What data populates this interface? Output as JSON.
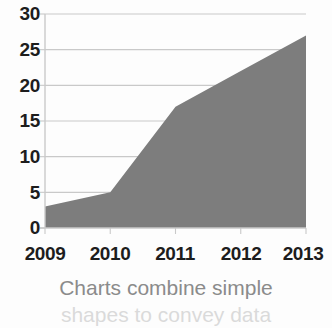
{
  "chart_data": {
    "type": "area",
    "title": "",
    "subtitle": "",
    "xlabel": "",
    "ylabel": "",
    "categories": [
      "2009",
      "2010",
      "2011",
      "2012",
      "2013"
    ],
    "x": [
      2009,
      2010,
      2011,
      2012,
      2013
    ],
    "values": [
      3,
      5,
      17,
      22,
      27
    ],
    "series": [
      {
        "name": "",
        "values": [
          3,
          5,
          17,
          22,
          27
        ],
        "color": "#7d7d7d"
      }
    ],
    "ylim": [
      0,
      30
    ],
    "xlim": [
      2009,
      2013
    ],
    "yticks": [
      0,
      5,
      10,
      15,
      20,
      25,
      30
    ],
    "ytick_labels": [
      "0",
      "5",
      "10",
      "15",
      "20",
      "25",
      "30"
    ],
    "xticks": [
      2009,
      2010,
      2011,
      2012,
      2013
    ],
    "xtick_labels": [
      "2009",
      "2010",
      "2011",
      "2012",
      "2013"
    ],
    "grid": "horizontal",
    "legend": "none",
    "annotations": []
  },
  "style": {
    "area_fill": "#7d7d7d",
    "gridline_color": "#c9c9c9",
    "axis_color": "#c9c9c9",
    "tick_label_color": "#1d1d1d",
    "caption_color": "#8b8b8b",
    "background": "#fdfdfd"
  },
  "caption": {
    "line1": "Charts combine simple",
    "line2": "shapes to convey data"
  }
}
